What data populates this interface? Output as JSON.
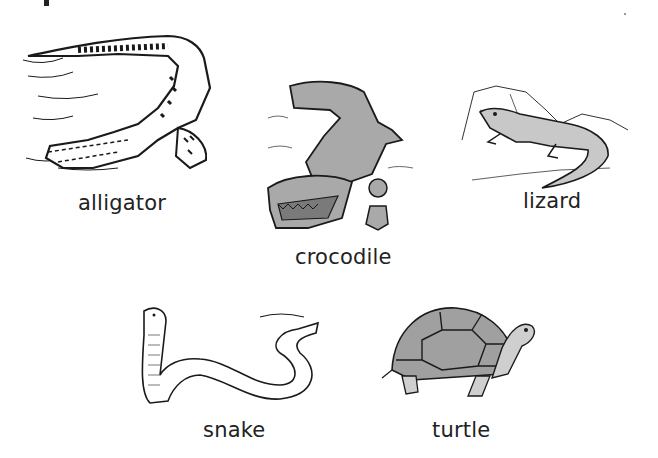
{
  "animals": [
    {
      "id": "alligator",
      "label": "alligator",
      "icon": "alligator-illustration"
    },
    {
      "id": "crocodile",
      "label": "crocodile",
      "icon": "crocodile-illustration"
    },
    {
      "id": "lizard",
      "label": "lizard",
      "icon": "lizard-illustration"
    },
    {
      "id": "snake",
      "label": "snake",
      "icon": "snake-illustration"
    },
    {
      "id": "turtle",
      "label": "turtle",
      "icon": "turtle-illustration"
    }
  ],
  "colors": {
    "ink": "#1a1a1a",
    "fill_gray": "#a9a9a9",
    "background": "#ffffff"
  }
}
